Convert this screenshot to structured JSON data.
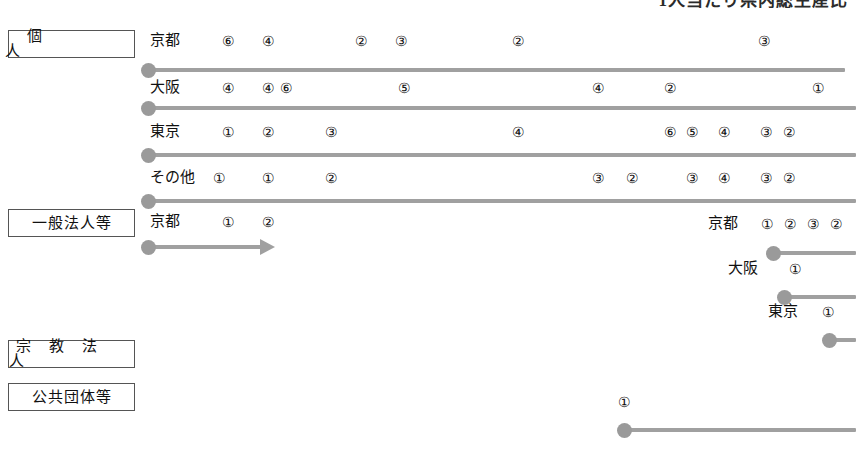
{
  "heading": {
    "text": "1人当たり県内総生産比",
    "note_visible": "clipped-top"
  },
  "categories": [
    {
      "id": "individual",
      "label": "個　　人",
      "spacing": "wide"
    },
    {
      "id": "general-corporation",
      "label": "一般法人等",
      "spacing": "none"
    },
    {
      "id": "religious-corporation",
      "label": "宗 教 法 人",
      "spacing": "mid"
    },
    {
      "id": "public-body",
      "label": "公共団体等",
      "spacing": "none"
    }
  ],
  "rows": [
    {
      "id": "individual-kyoto",
      "category": "individual",
      "name": "京都",
      "bar": {
        "start": 147,
        "end": 845,
        "y": 68,
        "dot": true,
        "arrow": false
      },
      "markers": [
        {
          "label": "⑥",
          "x": 222
        },
        {
          "label": "④",
          "x": 262
        },
        {
          "label": "②",
          "x": 355
        },
        {
          "label": "③",
          "x": 395
        },
        {
          "label": "②",
          "x": 512
        },
        {
          "label": "③",
          "x": 758
        }
      ]
    },
    {
      "id": "individual-osaka",
      "category": "individual",
      "name": "大阪",
      "bar": {
        "start": 147,
        "end": 856,
        "y": 106,
        "dot": true,
        "arrow": false
      },
      "markers": [
        {
          "label": "④",
          "x": 222
        },
        {
          "label": "④",
          "x": 262
        },
        {
          "label": "⑥",
          "x": 280
        },
        {
          "label": "⑤",
          "x": 398
        },
        {
          "label": "④",
          "x": 592
        },
        {
          "label": "②",
          "x": 664
        },
        {
          "label": "①",
          "x": 812
        }
      ]
    },
    {
      "id": "individual-tokyo",
      "category": "individual",
      "name": "東京",
      "bar": {
        "start": 147,
        "end": 856,
        "y": 153,
        "dot": true,
        "arrow": false
      },
      "markers": [
        {
          "label": "①",
          "x": 222
        },
        {
          "label": "②",
          "x": 262
        },
        {
          "label": "③",
          "x": 325
        },
        {
          "label": "④",
          "x": 512
        },
        {
          "label": "⑥",
          "x": 664
        },
        {
          "label": "⑤",
          "x": 686
        },
        {
          "label": "④",
          "x": 718
        },
        {
          "label": "③",
          "x": 760
        },
        {
          "label": "②",
          "x": 783
        }
      ]
    },
    {
      "id": "individual-other",
      "category": "individual",
      "name": "その他",
      "bar": {
        "start": 147,
        "end": 856,
        "y": 199,
        "dot": true,
        "arrow": false
      },
      "markers": [
        {
          "label": "①",
          "x": 213
        },
        {
          "label": "①",
          "x": 262
        },
        {
          "label": "②",
          "x": 325
        },
        {
          "label": "③",
          "x": 592
        },
        {
          "label": "②",
          "x": 626
        },
        {
          "label": "③",
          "x": 686
        },
        {
          "label": "④",
          "x": 718
        },
        {
          "label": "③",
          "x": 760
        },
        {
          "label": "②",
          "x": 783
        }
      ]
    },
    {
      "id": "general-kyoto-left",
      "category": "general-corporation",
      "name": "京都",
      "bar": {
        "start": 147,
        "end": 262,
        "y": 245,
        "dot": true,
        "arrow": true
      },
      "markers": [
        {
          "label": "①",
          "x": 222
        },
        {
          "label": "②",
          "x": 262
        }
      ]
    },
    {
      "id": "general-kyoto-right",
      "category": "general-corporation",
      "name": "京都",
      "bar": {
        "start": 772,
        "end": 856,
        "y": 251,
        "dot": true,
        "arrow": false
      },
      "name_x": 708,
      "markers": [
        {
          "label": "①",
          "x": 761
        },
        {
          "label": "②",
          "x": 784
        },
        {
          "label": "③",
          "x": 807
        },
        {
          "label": "②",
          "x": 830
        }
      ]
    },
    {
      "id": "general-osaka-right",
      "category": "general-corporation",
      "name": "大阪",
      "bar": {
        "start": 783,
        "end": 856,
        "y": 295,
        "dot": true,
        "arrow": false
      },
      "name_x": 728,
      "markers": [
        {
          "label": "①",
          "x": 789
        }
      ]
    },
    {
      "id": "general-tokyo-right",
      "category": "general-corporation",
      "name": "東京",
      "bar": {
        "start": 828,
        "end": 856,
        "y": 338,
        "dot": true,
        "arrow": false
      },
      "name_x": 768,
      "markers": [
        {
          "label": "①",
          "x": 822
        }
      ]
    },
    {
      "id": "public-body-row",
      "category": "public-body",
      "name": "",
      "bar": {
        "start": 623,
        "end": 856,
        "y": 428,
        "dot": true,
        "arrow": false
      },
      "markers": [
        {
          "label": "①",
          "x": 618
        }
      ]
    }
  ],
  "colors": {
    "bar": "#a0a0a0",
    "dot": "#9a9a9a",
    "box_border": "#555555",
    "text": "#111111",
    "background": "#ffffff"
  }
}
